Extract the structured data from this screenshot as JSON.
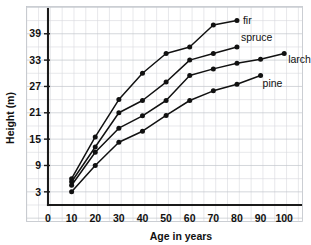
{
  "chart_data": {
    "type": "line",
    "title": "",
    "xlabel": "Age in years",
    "ylabel": "Height (m)",
    "xlim": [
      0,
      105
    ],
    "ylim": [
      0,
      43.5
    ],
    "xticks": [
      0,
      10,
      20,
      30,
      40,
      50,
      60,
      70,
      80,
      90,
      100
    ],
    "yticks": [
      3,
      9,
      15,
      21,
      27,
      33,
      39
    ],
    "grid": true,
    "grid_step_x": 5,
    "grid_step_y": 3,
    "legend": "inline-right-end-labels",
    "marker": "filled-circle",
    "line_color": "#111111",
    "series": [
      {
        "name": "fir",
        "label": "fir",
        "x": [
          10,
          20,
          30,
          40,
          50,
          60,
          70,
          80
        ],
        "values": [
          6.0,
          15.5,
          24.0,
          30.0,
          34.5,
          36.0,
          41.0,
          42.0
        ]
      },
      {
        "name": "spruce",
        "label": "spruce",
        "x": [
          10,
          20,
          30,
          40,
          50,
          60,
          70,
          80
        ],
        "values": [
          5.3,
          13.2,
          21.0,
          23.8,
          28.0,
          33.0,
          34.5,
          36.0
        ]
      },
      {
        "name": "larch",
        "label": "larch",
        "x": [
          10,
          20,
          30,
          40,
          50,
          60,
          70,
          80,
          90,
          100
        ],
        "values": [
          4.5,
          12.0,
          17.5,
          20.3,
          23.8,
          29.5,
          31.0,
          32.3,
          33.2,
          34.5
        ]
      },
      {
        "name": "pine",
        "label": "pine",
        "x": [
          10,
          20,
          30,
          40,
          50,
          60,
          70,
          80,
          90
        ],
        "values": [
          3.0,
          9.0,
          14.3,
          16.8,
          20.4,
          23.8,
          26.0,
          27.5,
          29.5
        ]
      }
    ]
  }
}
